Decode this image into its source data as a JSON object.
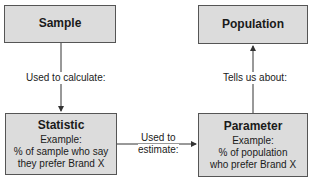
{
  "nodes": {
    "sample": {
      "title": "Sample"
    },
    "population": {
      "title": "Population"
    },
    "statistic": {
      "title": "Statistic",
      "example_label": "Example:",
      "example_line1": "% of sample who say",
      "example_line2": "they prefer Brand X"
    },
    "parameter": {
      "title": "Parameter",
      "example_label": "Example:",
      "example_line1": "% of population",
      "example_line2": "who prefer Brand X"
    }
  },
  "edges": {
    "sample_to_statistic": {
      "label": "Used to calculate:"
    },
    "statistic_to_parameter": {
      "label_line1": "Used to",
      "label_line2": "estimate:"
    },
    "parameter_to_population": {
      "label": "Tells us about:"
    }
  },
  "colors": {
    "box_fill": "#dcdcdc",
    "box_border": "#555555",
    "line": "#333333"
  }
}
